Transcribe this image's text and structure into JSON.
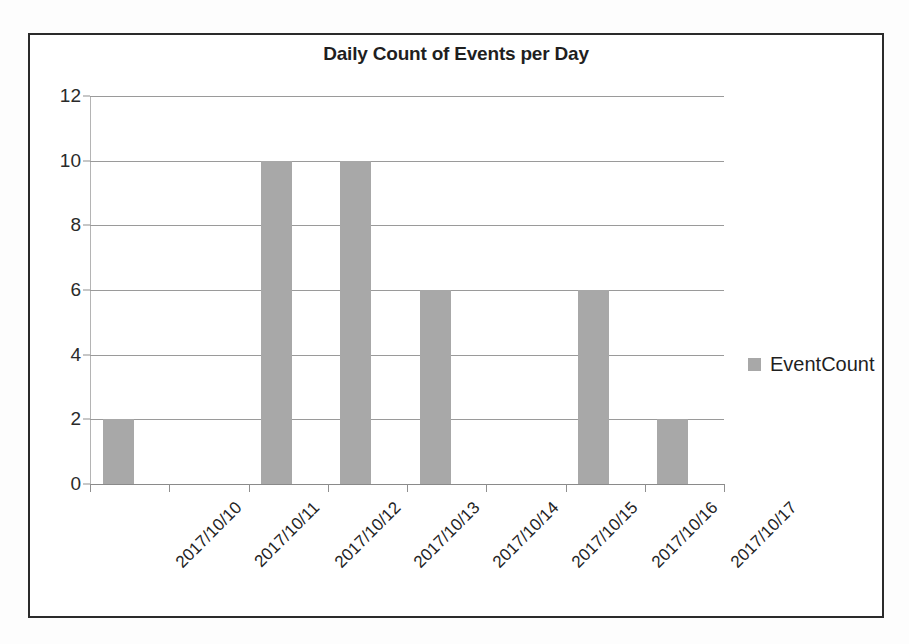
{
  "chart_data": {
    "type": "bar",
    "title": "Daily Count of Events per Day",
    "xlabel": "",
    "ylabel": "",
    "categories": [
      "2017/10/10",
      "2017/10/11",
      "2017/10/12",
      "2017/10/13",
      "2017/10/14",
      "2017/10/15",
      "2017/10/16",
      "2017/10/17"
    ],
    "series": [
      {
        "name": "EventCount",
        "values": [
          2,
          0,
          10,
          10,
          6,
          0,
          6,
          2
        ],
        "color": "#a8a8a8"
      }
    ],
    "ylim": [
      0,
      12
    ],
    "ytick_values": [
      0,
      2,
      4,
      6,
      8,
      10,
      12
    ],
    "ytick_labels": [
      "0",
      "2",
      "4",
      "6",
      "8",
      "10",
      "12"
    ],
    "grid": true,
    "grid_axis": "y",
    "legend": {
      "position": "right",
      "entries": [
        {
          "label": "EventCount",
          "color": "#a8a8a8"
        }
      ]
    },
    "xtick_rotation": -45
  },
  "frame": {
    "border_color": "#2b2b2b",
    "background": "#ffffff"
  }
}
